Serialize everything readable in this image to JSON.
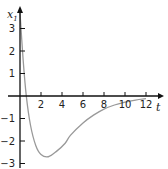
{
  "chart_data": {
    "type": "line",
    "title": "",
    "xlabel": "t",
    "ylabel": "x1",
    "ylabel_main": "x",
    "ylabel_sub": "1",
    "xlim": [
      0,
      13
    ],
    "ylim": [
      -3.3,
      3.8
    ],
    "grid": false,
    "legend": null,
    "x_ticks": [
      2,
      4,
      6,
      8,
      10,
      12
    ],
    "x_tick_labels": [
      "2",
      "4",
      "6",
      "8",
      "10",
      "12"
    ],
    "y_ticks": [
      3,
      2,
      1,
      -1,
      -2,
      -3
    ],
    "y_tick_labels": [
      "3",
      "2",
      "1",
      "−1",
      "−2",
      "−3"
    ],
    "series": [
      {
        "name": "x1(t)",
        "color": "#999999",
        "x": [
          0,
          0.3,
          0.6,
          1.0,
          1.5,
          2.0,
          2.7,
          3.5,
          4.3,
          4.8,
          6.0,
          7.0,
          8.0,
          9.0,
          10.0,
          11.0,
          12.0
        ],
        "y": [
          3.7,
          1.6,
          0.0,
          -1.3,
          -2.2,
          -2.6,
          -2.7,
          -2.45,
          -2.1,
          -1.75,
          -1.2,
          -0.85,
          -0.58,
          -0.4,
          -0.27,
          -0.18,
          -0.12
        ]
      }
    ]
  }
}
